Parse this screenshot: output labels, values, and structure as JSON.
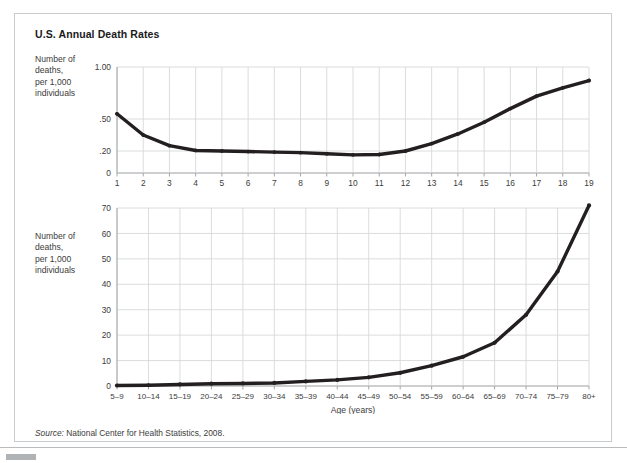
{
  "figure": {
    "title": "U.S. Annual Death Rates",
    "source_prefix": "Source:",
    "source_text": " National Center for Health Statistics, 2008."
  },
  "colors": {
    "line": "#231f20",
    "grid": "#d6d8da",
    "axis": "#9a9da0",
    "frame": "#c9cbcd",
    "text": "#3c3c3c",
    "title": "#1a1a1a"
  },
  "chart_data": [
    {
      "type": "line",
      "id": "children-death-rates",
      "title": "U.S. Annual Death Rates",
      "xlabel": "Age (years)",
      "ylabel": "Number of deaths, per 1,000 individuals",
      "grid": true,
      "legend": "none",
      "scale_note": "non-linear y axis; ticks at 0, .20, .50, 1.00",
      "ytick_labels": [
        "1.00",
        ".50",
        ".20",
        "0"
      ],
      "ytick_values": [
        1.0,
        0.5,
        0.2,
        0
      ],
      "ylim": [
        0,
        1.0
      ],
      "categories": [
        "1",
        "2",
        "3",
        "4",
        "5",
        "6",
        "7",
        "8",
        "9",
        "10",
        "11",
        "12",
        "13",
        "14",
        "15",
        "16",
        "17",
        "18",
        "19"
      ],
      "x": [
        1,
        2,
        3,
        4,
        5,
        6,
        7,
        8,
        9,
        10,
        11,
        12,
        13,
        14,
        15,
        16,
        17,
        18,
        19
      ],
      "values": [
        0.55,
        0.35,
        0.25,
        0.205,
        0.2,
        0.195,
        0.19,
        0.185,
        0.175,
        0.165,
        0.168,
        0.2,
        0.27,
        0.36,
        0.47,
        0.6,
        0.72,
        0.8,
        0.87
      ]
    },
    {
      "type": "line",
      "id": "age-band-death-rates",
      "title": "U.S. Annual Death Rates",
      "xlabel": "Age (years)",
      "ylabel": "Number of deaths, per 1,000 individuals",
      "grid": true,
      "legend": "none",
      "ytick_labels": [
        "0",
        "10",
        "20",
        "30",
        "40",
        "50",
        "60",
        "70"
      ],
      "ytick_values": [
        0,
        10,
        20,
        30,
        40,
        50,
        60,
        70
      ],
      "ylim": [
        0,
        70
      ],
      "categories": [
        "5–9",
        "10–14",
        "15–19",
        "20–24",
        "25–29",
        "30–34",
        "35–39",
        "40–44",
        "45–49",
        "50–54",
        "55–59",
        "60–64",
        "65–69",
        "70–74",
        "75–79",
        "80+"
      ],
      "values": [
        0.2,
        0.3,
        0.6,
        0.9,
        1.0,
        1.2,
        1.8,
        2.4,
        3.4,
        5.2,
        8.0,
        11.5,
        17.0,
        28.0,
        45.0,
        71.0
      ]
    }
  ]
}
